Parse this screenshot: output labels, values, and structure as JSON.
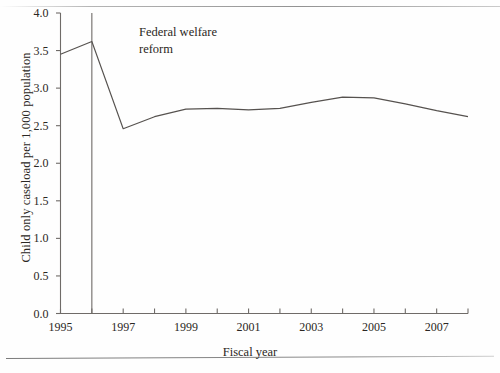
{
  "chart_data": {
    "type": "line",
    "title": "",
    "xlabel": "Fiscal year",
    "ylabel": "Child only caseload per 1,000 population",
    "xlim": [
      1995,
      2008
    ],
    "ylim": [
      0.0,
      4.0
    ],
    "grid": false,
    "legend": null,
    "x": [
      1995,
      1996,
      1997,
      1998,
      1999,
      2000,
      2001,
      2002,
      2003,
      2004,
      2005,
      2006,
      2007,
      2008
    ],
    "values": [
      3.45,
      3.62,
      2.46,
      2.62,
      2.72,
      2.73,
      2.71,
      2.73,
      2.81,
      2.88,
      2.87,
      2.79,
      2.7,
      2.62
    ],
    "series": [
      {
        "name": "Child only caseload per 1,000 population",
        "values": [
          3.45,
          3.62,
          2.46,
          2.62,
          2.72,
          2.73,
          2.71,
          2.73,
          2.81,
          2.88,
          2.87,
          2.79,
          2.7,
          2.62
        ]
      }
    ],
    "ytick_labels": [
      "0.0",
      "0.5",
      "1.0",
      "1.5",
      "2.0",
      "2.5",
      "3.0",
      "3.5",
      "4.0"
    ],
    "ytick_values": [
      0.0,
      0.5,
      1.0,
      1.5,
      2.0,
      2.5,
      3.0,
      3.5,
      4.0
    ],
    "xtick_values": [
      1995,
      1996,
      1997,
      1998,
      1999,
      2000,
      2001,
      2002,
      2003,
      2004,
      2005,
      2006,
      2007,
      2008
    ],
    "xtick_labels": [
      "1995",
      "",
      "1997",
      "",
      "1999",
      "",
      "2001",
      "",
      "2003",
      "",
      "2005",
      "",
      "2007",
      ""
    ],
    "xtick_labels_shown": [
      "1995",
      "1997",
      "1999",
      "2001",
      "2003",
      "2005",
      "2007"
    ],
    "annotations": [
      {
        "text": "Federal welfare\nreform",
        "x": 1996,
        "type": "vertical-reference-line",
        "line_from": 4.0,
        "line_to": 0.0
      }
    ],
    "line_color": "#56524f",
    "axis_color": "#6f6b68"
  },
  "chart": {
    "y_axis_title": "Child only caseload per 1,000 population",
    "x_axis_title": "Fiscal year",
    "annotation_text": "Federal welfare\nreform",
    "y_ticks": [
      "4.0",
      "3.5",
      "3.0",
      "2.5",
      "2.0",
      "1.5",
      "1.0",
      "0.5",
      "0.0"
    ],
    "x_ticks": [
      "1995",
      "1997",
      "1999",
      "2001",
      "2003",
      "2005",
      "2007"
    ]
  }
}
